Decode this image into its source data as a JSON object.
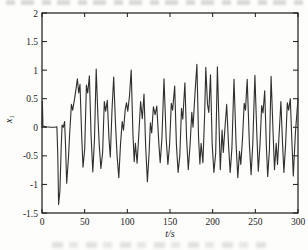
{
  "figure": {
    "xlabel": "t/s",
    "ylabel_base": "x",
    "ylabel_sub": "1"
  },
  "colors": {
    "line": "#2e2e2e",
    "frame": "#1a1a1a",
    "background": "#fdfdfb"
  },
  "chart_data": {
    "type": "line",
    "title": "",
    "xlabel": "t/s",
    "ylabel": "x_1",
    "xlim": [
      0,
      300
    ],
    "ylim": [
      -1.5,
      2
    ],
    "x_ticks": [
      0,
      50,
      100,
      150,
      200,
      250,
      300
    ],
    "y_ticks": [
      2,
      1.5,
      1,
      0.5,
      0,
      -0.5,
      -1,
      -1.5
    ],
    "grid": false,
    "legend_position": "none",
    "series": [
      {
        "name": "x1 time series",
        "points": [
          [
            0,
            0
          ],
          [
            0.5,
            0.45
          ],
          [
            1,
            0.02
          ],
          [
            5,
            0.01
          ],
          [
            10,
            0
          ],
          [
            15,
            0
          ],
          [
            17.5,
            0.01
          ],
          [
            18.5,
            -0.5
          ],
          [
            19.5,
            -1.35
          ],
          [
            21,
            -1.12
          ],
          [
            22.5,
            -0.35
          ],
          [
            23.5,
            0.04
          ],
          [
            25,
            0
          ],
          [
            26.5,
            0.1
          ],
          [
            27.5,
            -0.3
          ],
          [
            29,
            -0.98
          ],
          [
            31,
            -0.52
          ],
          [
            32.5,
            -0.1
          ],
          [
            34.5,
            0.4
          ],
          [
            36,
            0.3
          ],
          [
            38,
            0.48
          ],
          [
            40,
            0.68
          ],
          [
            41.5,
            0.85
          ],
          [
            43,
            0.6
          ],
          [
            44.5,
            0.75
          ],
          [
            46.5,
            -0.15
          ],
          [
            48,
            -0.7
          ],
          [
            50,
            -0.38
          ],
          [
            52,
            0.74
          ],
          [
            53.5,
            0.6
          ],
          [
            55.5,
            0.9
          ],
          [
            57.5,
            -0.15
          ],
          [
            59.5,
            -0.78
          ],
          [
            61.5,
            -0.2
          ],
          [
            63.5,
            1.02
          ],
          [
            65.5,
            0.2
          ],
          [
            67,
            -0.3
          ],
          [
            69,
            -0.72
          ],
          [
            71,
            -0.45
          ],
          [
            73,
            0.45
          ],
          [
            74.5,
            0.28
          ],
          [
            76.5,
            0.47
          ],
          [
            78.5,
            -0.2
          ],
          [
            80,
            -0.52
          ],
          [
            82,
            0.3
          ],
          [
            84,
            0.88
          ],
          [
            86,
            0.1
          ],
          [
            88,
            -0.5
          ],
          [
            90,
            -0.88
          ],
          [
            92,
            -0.3
          ],
          [
            94,
            0.1
          ],
          [
            95.5,
            -0.05
          ],
          [
            97.5,
            0.3
          ],
          [
            99,
            0.43
          ],
          [
            100.5,
            0.28
          ],
          [
            102.5,
            0.55
          ],
          [
            104.5,
            1
          ],
          [
            106.5,
            -0.1
          ],
          [
            108,
            -0.6
          ],
          [
            109.5,
            -0.28
          ],
          [
            111.5,
            -0.63
          ],
          [
            113.5,
            -0.1
          ],
          [
            115.5,
            0.45
          ],
          [
            117.5,
            0.15
          ],
          [
            119.5,
            0.58
          ],
          [
            121.5,
            -0.35
          ],
          [
            123.5,
            -0.95
          ],
          [
            125.5,
            -0.45
          ],
          [
            127,
            0.08
          ],
          [
            128.5,
            -0.1
          ],
          [
            130.5,
            0.36
          ],
          [
            132.5,
            0.22
          ],
          [
            134.5,
            0.37
          ],
          [
            137,
            -0.3
          ],
          [
            138.5,
            -0.62
          ],
          [
            140.5,
            -0.2
          ],
          [
            143,
            0.85
          ],
          [
            145.5,
            -0.2
          ],
          [
            147.5,
            -0.65
          ],
          [
            149.5,
            -0.3
          ],
          [
            151.5,
            0.42
          ],
          [
            153,
            0.3
          ],
          [
            155.5,
            0.72
          ],
          [
            157.5,
            -0.3
          ],
          [
            159.5,
            -0.79
          ],
          [
            161.5,
            -0.5
          ],
          [
            163.5,
            0.33
          ],
          [
            165,
            0.14
          ],
          [
            167.5,
            0.78
          ],
          [
            169.5,
            -0.2
          ],
          [
            171.5,
            -0.74
          ],
          [
            173.5,
            -0.3
          ],
          [
            175.5,
            0.26
          ],
          [
            177,
            0
          ],
          [
            179.5,
            0.65
          ],
          [
            181.5,
            1.1
          ],
          [
            183.5,
            -0.2
          ],
          [
            185,
            -0.64
          ],
          [
            186.5,
            -0.28
          ],
          [
            188.5,
            -0.62
          ],
          [
            190.5,
            0.2
          ],
          [
            192,
            1.05
          ],
          [
            194,
            0.4
          ],
          [
            195.5,
            0.26
          ],
          [
            197.5,
            0.92
          ],
          [
            199.5,
            -0.3
          ],
          [
            201.5,
            -0.79
          ],
          [
            203.5,
            -0.45
          ],
          [
            205.5,
            1.06
          ],
          [
            207.5,
            0
          ],
          [
            209,
            -0.74
          ],
          [
            211,
            -0.05
          ],
          [
            212.5,
            -0.44
          ],
          [
            214.5,
            0
          ],
          [
            216.5,
            0.4
          ],
          [
            218.5,
            -0.3
          ],
          [
            220.5,
            -0.79
          ],
          [
            222.5,
            -0.37
          ],
          [
            225,
            0.84
          ],
          [
            227.5,
            -0.3
          ],
          [
            229.5,
            -0.88
          ],
          [
            231.5,
            -0.42
          ],
          [
            233,
            -0.65
          ],
          [
            235,
            -0.2
          ],
          [
            237,
            0.42
          ],
          [
            238.5,
            0.3
          ],
          [
            240.5,
            0.84
          ],
          [
            243,
            -0.3
          ],
          [
            245,
            -0.83
          ],
          [
            247,
            -0.28
          ],
          [
            249.5,
            0.91
          ],
          [
            252,
            -0.2
          ],
          [
            253.5,
            -0.77
          ],
          [
            255.5,
            -0.3
          ],
          [
            257.5,
            0.38
          ],
          [
            259,
            0.25
          ],
          [
            261,
            0.64
          ],
          [
            263,
            -0.35
          ],
          [
            264.5,
            -0.86
          ],
          [
            266.5,
            -0.4
          ],
          [
            268.5,
            0.89
          ],
          [
            271,
            -0.2
          ],
          [
            272.5,
            -0.74
          ],
          [
            274.5,
            -0.28
          ],
          [
            276,
            -0.65
          ],
          [
            278,
            -0.1
          ],
          [
            280,
            0.45
          ],
          [
            282,
            -0.3
          ],
          [
            283.5,
            -0.79
          ],
          [
            285.5,
            -0.3
          ],
          [
            287.5,
            0.43
          ],
          [
            289,
            0.3
          ],
          [
            291,
            0.5
          ],
          [
            293,
            -0.3
          ],
          [
            294.5,
            -0.85
          ],
          [
            297,
            -0.1
          ],
          [
            300,
            0.5
          ]
        ]
      }
    ]
  }
}
